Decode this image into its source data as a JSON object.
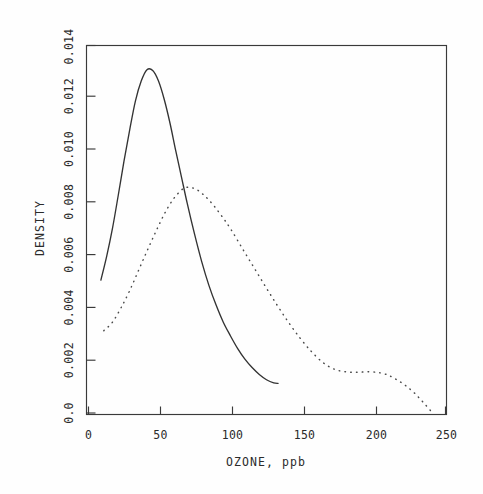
{
  "figure": {
    "background_color": "#fefefe",
    "frame_color": "#3a3a3a",
    "width": 483,
    "height": 494
  },
  "axis": {
    "x_title": "OZONE, ppb",
    "y_title": "DENSITY",
    "x_ticks": [
      "0",
      "50",
      "100",
      "150",
      "200",
      "250"
    ],
    "y_ticks": [
      "0.0",
      "0.002",
      "0.004",
      "0.006",
      "0.008",
      "0.010",
      "0.012",
      "0.014"
    ]
  },
  "chart_data": {
    "type": "line",
    "title": "",
    "xlabel": "OZONE, ppb",
    "ylabel": "DENSITY",
    "xlim": [
      0,
      250
    ],
    "ylim": [
      0.0,
      0.014
    ],
    "grid": false,
    "legend": "none",
    "xticks": [
      0,
      50,
      100,
      150,
      200,
      250
    ],
    "yticks": [
      0.0,
      0.002,
      0.004,
      0.006,
      0.008,
      0.01,
      0.012,
      0.014
    ],
    "series": [
      {
        "name": "solid-curve",
        "style": "solid",
        "color": "#333333",
        "x": [
          10,
          14,
          18,
          22,
          26,
          30,
          34,
          38,
          42,
          46,
          50,
          54,
          58,
          62,
          66,
          70,
          75,
          80,
          85,
          90,
          95,
          100,
          105,
          110,
          115,
          120,
          125,
          130,
          133
        ],
        "y": [
          0.0051,
          0.006,
          0.00705,
          0.0083,
          0.0096,
          0.0108,
          0.0119,
          0.01265,
          0.01308,
          0.01305,
          0.01265,
          0.01195,
          0.01105,
          0.01,
          0.009,
          0.008,
          0.00685,
          0.0058,
          0.0049,
          0.00415,
          0.0035,
          0.00298,
          0.0025,
          0.0021,
          0.00178,
          0.00152,
          0.00132,
          0.0012,
          0.00118
        ]
      },
      {
        "name": "dotted-curve",
        "style": "dotted",
        "color": "#4a4a4a",
        "x": [
          12,
          18,
          24,
          30,
          36,
          42,
          48,
          54,
          60,
          66,
          70,
          76,
          82,
          88,
          94,
          100,
          108,
          116,
          124,
          132,
          140,
          148,
          156,
          164,
          172,
          180,
          188,
          196,
          204,
          210,
          216,
          222,
          228,
          234,
          240
        ],
        "y": [
          0.00318,
          0.0035,
          0.00405,
          0.0047,
          0.00545,
          0.0062,
          0.00692,
          0.0076,
          0.00815,
          0.00852,
          0.00862,
          0.00855,
          0.0083,
          0.00795,
          0.00752,
          0.00705,
          0.00632,
          0.0056,
          0.00488,
          0.00418,
          0.00352,
          0.00292,
          0.0024,
          0.00198,
          0.00172,
          0.00162,
          0.0016,
          0.00162,
          0.00158,
          0.00148,
          0.0013,
          0.00108,
          0.0008,
          0.00045,
          8e-05
        ]
      }
    ]
  }
}
